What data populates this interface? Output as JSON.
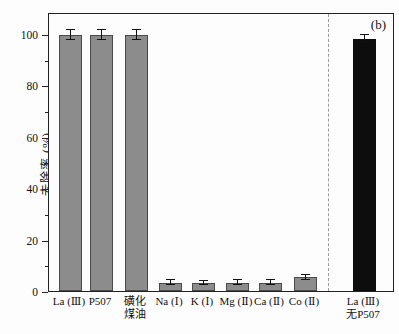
{
  "figure": {
    "panel_label": "(b)"
  },
  "chart_data": {
    "type": "bar",
    "title": "",
    "xlabel": "",
    "ylabel": "去除率 (%)",
    "ylim": [
      0,
      108.5
    ],
    "yticks_major": [
      0,
      20,
      40,
      60,
      80,
      100
    ],
    "yticks_minor": [
      10,
      30,
      50,
      70,
      90
    ],
    "grid": false,
    "legend": "none",
    "separator_after_index": 7,
    "categories": [
      "La (Ⅲ)",
      "P507",
      "磺化煤油",
      "Na (Ⅰ)",
      "K (Ⅰ)",
      "Mg (Ⅱ)",
      "Ca (Ⅱ)",
      "Co (Ⅱ)",
      "La (Ⅲ) 无P507"
    ],
    "bars": [
      {
        "label_lines": [
          "La (Ⅲ)"
        ],
        "value": 99.5,
        "error": 2.0,
        "color": "#8c8c8c"
      },
      {
        "label_lines": [
          "P507"
        ],
        "value": 99.5,
        "error": 2.0,
        "color": "#8c8c8c"
      },
      {
        "label_lines": [
          "磺化",
          "煤油"
        ],
        "value": 99.5,
        "error": 2.0,
        "color": "#8c8c8c"
      },
      {
        "label_lines": [
          "Na (Ⅰ)"
        ],
        "value": 3.3,
        "error": 0.8,
        "color": "#8c8c8c"
      },
      {
        "label_lines": [
          "K (Ⅰ)"
        ],
        "value": 3.2,
        "error": 0.8,
        "color": "#8c8c8c"
      },
      {
        "label_lines": [
          "Mg (Ⅱ)"
        ],
        "value": 3.3,
        "error": 0.8,
        "color": "#8c8c8c"
      },
      {
        "label_lines": [
          "Ca (Ⅱ)"
        ],
        "value": 3.3,
        "error": 0.8,
        "color": "#8c8c8c"
      },
      {
        "label_lines": [
          "Co (Ⅱ)"
        ],
        "value": 5.3,
        "error": 1.0,
        "color": "#8c8c8c"
      },
      {
        "label_lines": [
          "La (Ⅲ)",
          "无P507"
        ],
        "value": 98.0,
        "error": 1.5,
        "color": "#0d0d0d"
      }
    ],
    "colors": {
      "gray_bar": "#8c8c8c",
      "black_bar": "#0d0d0d",
      "bar_border": "#4a4a4a",
      "error_bar": "#111111",
      "frame": "#222222",
      "separator": "#9a9a9a"
    }
  }
}
